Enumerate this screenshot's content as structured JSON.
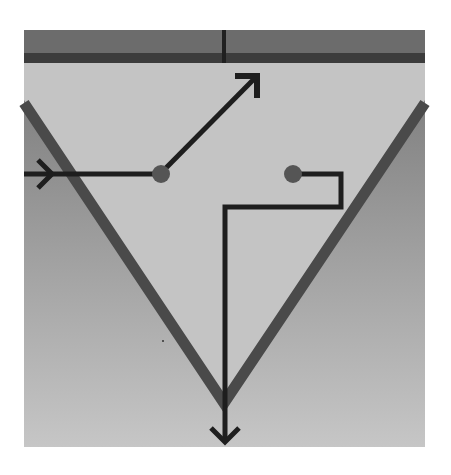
{
  "diagram": {
    "colors": {
      "background": "#ffffff",
      "top_band": "#6e6e6e",
      "top_stripe": "#3e3e3e",
      "inner_field": "#c4c4c4",
      "outer_gradient_top": "#7a7a7a",
      "outer_gradient_bottom": "#c8c8c8",
      "v_stroke": "#4a4a4a",
      "arrow_stroke": "#1e1e1e",
      "dot_fill": "#555555"
    },
    "nodes": [
      {
        "id": "left-junction",
        "x": 160,
        "y": 174
      },
      {
        "id": "right-junction",
        "x": 293,
        "y": 174
      }
    ],
    "arrows": [
      {
        "id": "incoming-left-arrow",
        "direction": "right"
      },
      {
        "id": "diagonal-up-arrow",
        "direction": "up-right"
      },
      {
        "id": "down-arrow",
        "direction": "down"
      }
    ]
  }
}
